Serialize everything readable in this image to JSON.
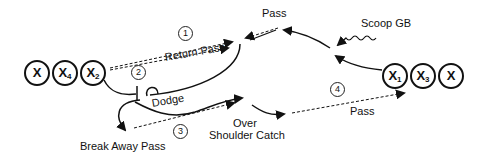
{
  "diagram": {
    "left_group": [
      {
        "id": "x",
        "label": "X",
        "sub": ""
      },
      {
        "id": "x4",
        "label": "X",
        "sub": "4"
      },
      {
        "id": "x2",
        "label": "X",
        "sub": "2"
      }
    ],
    "right_group": [
      {
        "id": "x1",
        "label": "X",
        "sub": "1"
      },
      {
        "id": "x3",
        "label": "X",
        "sub": "3"
      },
      {
        "id": "x",
        "label": "X",
        "sub": ""
      }
    ],
    "labels": {
      "pass_top": "Pass",
      "scoop_gb": "Scoop GB",
      "return_pass": "Return Pass",
      "dodge": "Dodge",
      "break_away_pass": "Break Away Pass",
      "over": "Over",
      "shoulder_catch": "Shoulder Catch",
      "pass_bottom": "Pass"
    },
    "steps": [
      "1",
      "2",
      "3",
      "4"
    ]
  }
}
